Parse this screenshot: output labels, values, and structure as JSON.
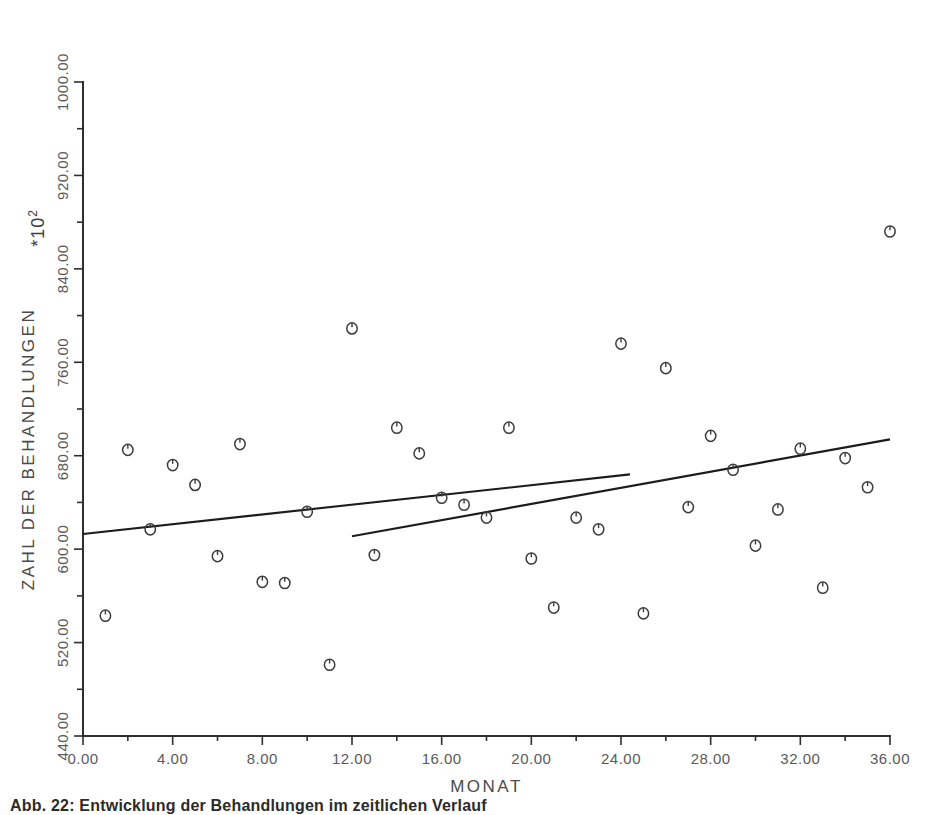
{
  "chart_data": {
    "type": "scatter",
    "title": "",
    "xlabel": "MONAT",
    "ylabel": "ZAHL DER BEHANDLUNGEN",
    "scale_note": "*10",
    "scale_exponent": "2",
    "xlim": [
      0,
      36
    ],
    "ylim": [
      440,
      1000
    ],
    "grid": false,
    "legend": false,
    "x_ticks": [
      "0.00",
      "4.00",
      "8.00",
      "12.00",
      "16.00",
      "20.00",
      "24.00",
      "28.00",
      "32.00",
      "36.00"
    ],
    "x_tick_values": [
      0,
      4,
      8,
      12,
      16,
      20,
      24,
      28,
      32,
      36
    ],
    "y_ticks": [
      "440.00",
      "520.00",
      "600.00",
      "680.00",
      "760.00",
      "840.00",
      "920.00",
      "1000.00"
    ],
    "y_tick_values": [
      440,
      520,
      600,
      680,
      760,
      840,
      920,
      1000
    ],
    "x_minor_interval": 2,
    "y_minor_interval": 40,
    "marker_style": "open-circle",
    "points": [
      {
        "x": 1,
        "y": 543
      },
      {
        "x": 2,
        "y": 685
      },
      {
        "x": 3,
        "y": 617
      },
      {
        "x": 4,
        "y": 672
      },
      {
        "x": 5,
        "y": 655
      },
      {
        "x": 6,
        "y": 594
      },
      {
        "x": 7,
        "y": 690
      },
      {
        "x": 8,
        "y": 572
      },
      {
        "x": 9,
        "y": 571
      },
      {
        "x": 10,
        "y": 632
      },
      {
        "x": 11,
        "y": 501
      },
      {
        "x": 12,
        "y": 789
      },
      {
        "x": 13,
        "y": 595
      },
      {
        "x": 14,
        "y": 704
      },
      {
        "x": 15,
        "y": 682
      },
      {
        "x": 16,
        "y": 644
      },
      {
        "x": 17,
        "y": 638
      },
      {
        "x": 18,
        "y": 627
      },
      {
        "x": 19,
        "y": 704
      },
      {
        "x": 20,
        "y": 592
      },
      {
        "x": 21,
        "y": 550
      },
      {
        "x": 22,
        "y": 627
      },
      {
        "x": 23,
        "y": 617
      },
      {
        "x": 24,
        "y": 776
      },
      {
        "x": 25,
        "y": 545
      },
      {
        "x": 26,
        "y": 755
      },
      {
        "x": 27,
        "y": 636
      },
      {
        "x": 28,
        "y": 697
      },
      {
        "x": 29,
        "y": 668
      },
      {
        "x": 30,
        "y": 603
      },
      {
        "x": 31,
        "y": 634
      },
      {
        "x": 32,
        "y": 686
      },
      {
        "x": 33,
        "y": 567
      },
      {
        "x": 34,
        "y": 678
      },
      {
        "x": 35,
        "y": 653
      },
      {
        "x": 36,
        "y": 872
      }
    ],
    "trend_lines": [
      {
        "name": "trend-line-full",
        "x0": 0,
        "y0": 613,
        "x1": 24.4,
        "y1": 664
      },
      {
        "name": "trend-line-partial",
        "x0": 12,
        "y0": 611,
        "x1": 36,
        "y1": 694
      }
    ]
  },
  "caption": {
    "text": "Abb. 22: Entwicklung der Behandlungen im zeitlichen Verlauf"
  }
}
